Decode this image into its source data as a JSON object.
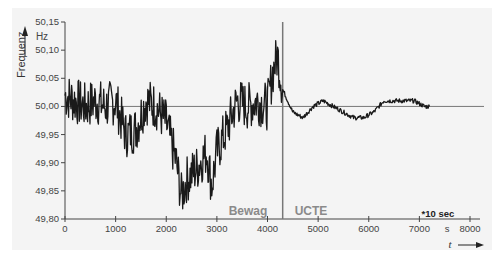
{
  "chart_data": {
    "type": "line",
    "title": "",
    "ylabel": "Frequenz",
    "yunit": "Hz",
    "xlabel": "t",
    "xunit": "s",
    "x_note": "*10 sec",
    "xlim": [
      0,
      8000
    ],
    "ylim": [
      49.8,
      50.15
    ],
    "x_ticks": [
      "0",
      "1000",
      "2000",
      "3000",
      "4000",
      "5000",
      "6000",
      "7000",
      "8000"
    ],
    "y_ticks": [
      "49,80",
      "49,85",
      "49,90",
      "49,95",
      "50,00",
      "50,05",
      "50,10",
      "50,15"
    ],
    "reference_line": 50.0,
    "divider_x": 4300,
    "regions": [
      {
        "label": "Bewag",
        "x_range": [
          0,
          4300
        ]
      },
      {
        "label": "UCTE",
        "x_range": [
          4300,
          8000
        ]
      }
    ],
    "series": [
      {
        "name": "Netzfrequenz",
        "x": [
          0,
          200,
          400,
          600,
          800,
          1000,
          1200,
          1400,
          1600,
          1800,
          2000,
          2200,
          2300,
          2400,
          2600,
          2800,
          2900,
          3000,
          3200,
          3400,
          3600,
          3800,
          4000,
          4100,
          4200,
          4300,
          4500,
          4700,
          4900,
          5100,
          5300,
          5500,
          5700,
          5900,
          6100,
          6300,
          6500,
          6700,
          6900,
          7100,
          7200
        ],
        "values": [
          50.02,
          50.01,
          50.0,
          50.01,
          50.0,
          50.01,
          49.95,
          49.96,
          50.01,
          50.0,
          49.97,
          49.9,
          49.84,
          49.87,
          49.89,
          49.92,
          49.86,
          49.92,
          49.96,
          50.01,
          50.0,
          50.01,
          50.0,
          50.06,
          50.09,
          50.03,
          49.99,
          49.98,
          50.0,
          50.01,
          50.0,
          49.99,
          49.98,
          49.98,
          49.99,
          50.01,
          50.01,
          50.01,
          50.01,
          50.0,
          50.0
        ]
      }
    ],
    "grid": false,
    "legend": "none"
  },
  "labels": {
    "y_axis_title": "Frequenz",
    "y_unit": "Hz",
    "x_axis_title": "t",
    "x_unit": "s",
    "x_note": "*10 sec",
    "region_left": "Bewag",
    "region_right": "UCTE"
  },
  "colors": {
    "line": "#1a1a1a",
    "axis": "#444444",
    "reference": "#777777",
    "region_text": "#8a8a8a",
    "background": "#f4f4f4"
  }
}
